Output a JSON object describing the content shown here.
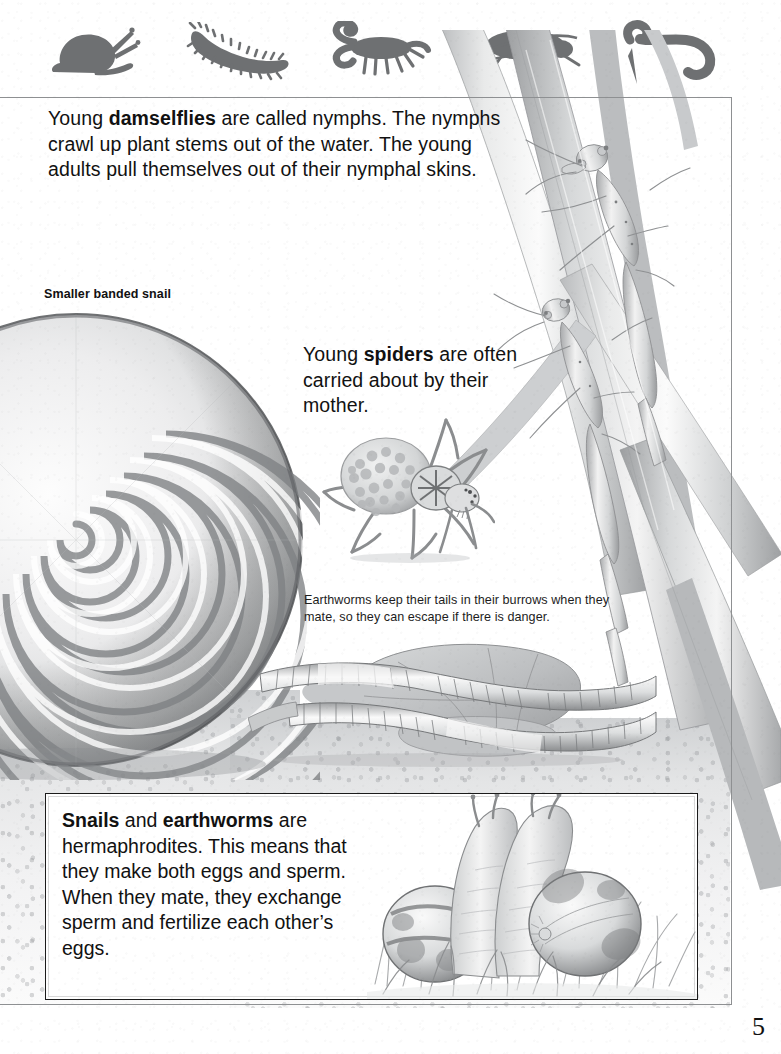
{
  "page": {
    "number": "5",
    "background_color": "#ffffff",
    "ink_color": "#111111",
    "frame_color": "#8e9092"
  },
  "header": {
    "silhouettes": [
      {
        "name": "snail-silhouette",
        "label": "snail"
      },
      {
        "name": "centipede-silhouette",
        "label": "centipede"
      },
      {
        "name": "scorpion-silhouette",
        "label": "scorpion"
      },
      {
        "name": "beetle-silhouette",
        "label": "beetle"
      },
      {
        "name": "worm-silhouette",
        "label": "worm"
      }
    ],
    "silhouette_color": "#6e7072"
  },
  "damselfly_block": {
    "line1_pre": "Young ",
    "line1_bold": "damselflies",
    "line1_post": " are called nymphs.",
    "rest": "The nymphs crawl up plant stems out of the water. The young adults pull themselves out of their nymphal skins."
  },
  "snail_caption": {
    "text": "Smaller banded snail"
  },
  "spider_block": {
    "pre": "Young ",
    "bold": "spiders",
    "post": " are often carried about by their mother."
  },
  "earthworm_caption": {
    "text": "Earthworms keep their tails in their burrows when they mate, so they can escape if there is danger."
  },
  "callout": {
    "pre": "",
    "bold1": "Snails",
    "mid": " and ",
    "bold2": "earthworms",
    "post": " are hermaphrodites. This means that they make both eggs and sperm. When they mate, they exchange sperm and fertilize each other’s eggs."
  },
  "illustrations": [
    {
      "name": "damselfly-nymphs-on-reeds",
      "alt": "Two damselfly nymphs climbing reed stems"
    },
    {
      "name": "banded-snail-shell",
      "alt": "Large spiral banded snail shell"
    },
    {
      "name": "wolf-spider-with-spiderlings",
      "alt": "Spider carrying young on its abdomen"
    },
    {
      "name": "mating-earthworms",
      "alt": "Two earthworms mating on leaves and soil"
    },
    {
      "name": "mating-snails-in-grass",
      "alt": "Two snails mating among grass"
    }
  ]
}
